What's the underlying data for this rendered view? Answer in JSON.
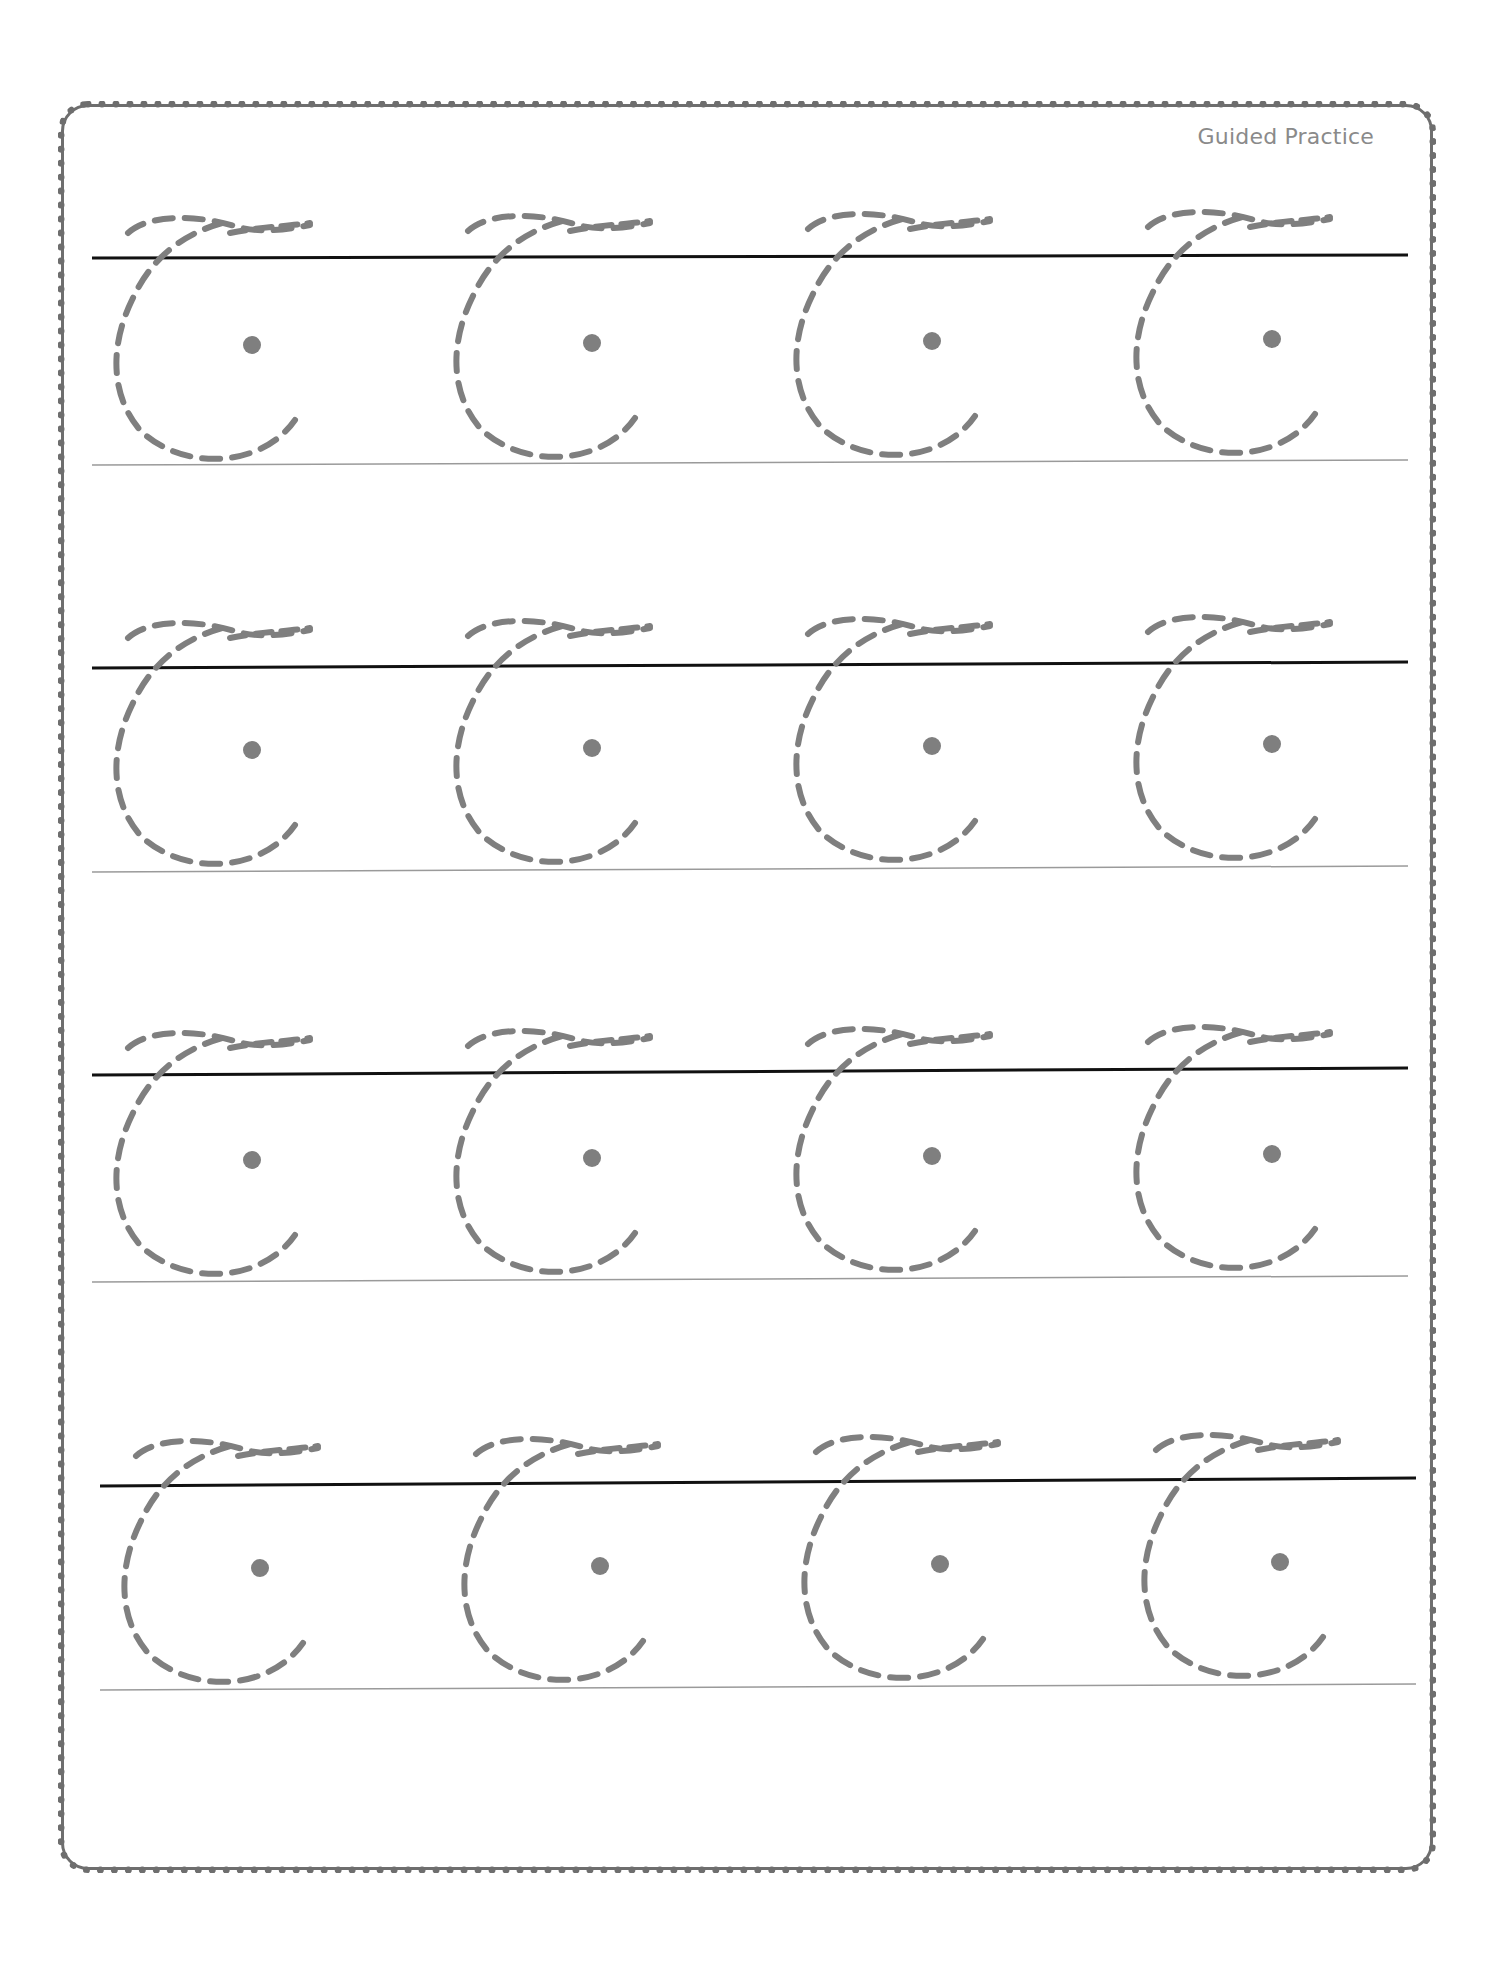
{
  "header": {
    "label": "Guided Practice"
  },
  "colors": {
    "border": "#6e6e6e",
    "headline": "#111111",
    "baseline": "#9a9a9a",
    "trace": "#7f7f7f",
    "dot": "#7f7f7f",
    "label": "#8a8a8a"
  },
  "glyph": {
    "character": "ꟾ-style looped c (tracing)",
    "style": "dashed"
  },
  "rows": [
    {
      "headline_y": [
        258,
        255
      ],
      "baseline_y": [
        465,
        460
      ],
      "x_range": [
        92,
        1408
      ],
      "glyph_x": [
        110,
        450,
        790,
        1130
      ],
      "glyph_top": 205
    },
    {
      "headline_y": [
        668,
        662
      ],
      "baseline_y": [
        872,
        866
      ],
      "x_range": [
        92,
        1408
      ],
      "glyph_x": [
        110,
        450,
        790,
        1130
      ],
      "glyph_top": 610
    },
    {
      "headline_y": [
        1075,
        1068
      ],
      "baseline_y": [
        1282,
        1276
      ],
      "x_range": [
        92,
        1408
      ],
      "glyph_x": [
        110,
        450,
        790,
        1130
      ],
      "glyph_top": 1020
    },
    {
      "headline_y": [
        1486,
        1478
      ],
      "baseline_y": [
        1690,
        1684
      ],
      "x_range": [
        100,
        1416
      ],
      "glyph_x": [
        118,
        458,
        798,
        1138
      ],
      "glyph_top": 1428
    }
  ]
}
